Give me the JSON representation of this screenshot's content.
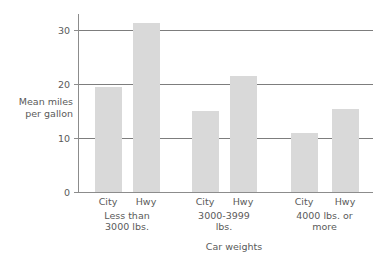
{
  "chart_data": {
    "type": "bar",
    "title": "",
    "subtitle": "",
    "xlabel": "Car weights",
    "ylabel": "Mean miles\nper gallon",
    "ylabel_line1": "Mean miles",
    "ylabel_line2": "per gallon",
    "ylim": [
      0,
      33
    ],
    "yticks": [
      0,
      10,
      20,
      30
    ],
    "ytick_labels": [
      "0",
      "10",
      "20",
      "30"
    ],
    "grid": "horizontal",
    "legend": "none",
    "categories": [
      "Less than 3000 lbs.",
      "3000-3999 lbs.",
      "4000 lbs. or more"
    ],
    "category_lines": [
      [
        "Less than",
        "3000 lbs."
      ],
      [
        "3000-3999",
        "lbs."
      ],
      [
        "4000 lbs. or",
        "more"
      ]
    ],
    "subcategories": [
      "City",
      "Hwy"
    ],
    "series": [
      {
        "name": "City",
        "values": [
          19.5,
          15.0,
          11.0
        ]
      },
      {
        "name": "Hwy",
        "values": [
          31.3,
          21.5,
          15.3
        ]
      }
    ],
    "bars": [
      {
        "group": "Less than 3000 lbs.",
        "series": "City",
        "value": 19.5
      },
      {
        "group": "Less than 3000 lbs.",
        "series": "Hwy",
        "value": 31.3
      },
      {
        "group": "3000-3999 lbs.",
        "series": "City",
        "value": 15.0
      },
      {
        "group": "3000-3999 lbs.",
        "series": "Hwy",
        "value": 21.5
      },
      {
        "group": "4000 lbs. or more",
        "series": "City",
        "value": 11.0
      },
      {
        "group": "4000 lbs. or more",
        "series": "Hwy",
        "value": 15.3
      }
    ],
    "colors": {
      "bar_fill": "#d9d9d9",
      "axis": "#8c8c8c",
      "grid": "#7d7d7d",
      "text": "#5a5a5a",
      "background": "#ffffff"
    }
  }
}
